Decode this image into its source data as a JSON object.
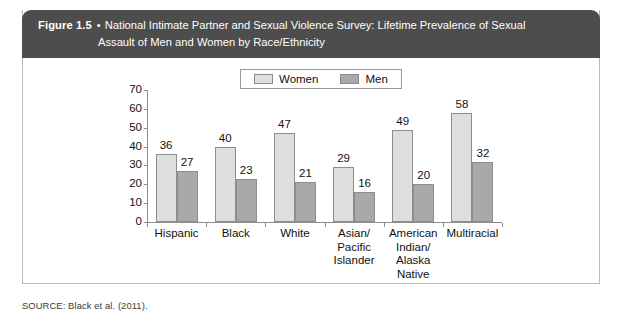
{
  "figure": {
    "number": "Figure 1.5",
    "bullet": "•",
    "caption_line1": "National Intimate Partner and Sexual Violence Survey: Lifetime Prevalence of Sexual",
    "caption_line2": "Assault of Men and Women by Race/Ethnicity",
    "source": "SOURCE: Black et al. (2011)."
  },
  "legend": {
    "women_label": "Women",
    "men_label": "Men"
  },
  "colors": {
    "header_bg": "#4d4d4d",
    "women_bar": "#dedede",
    "men_bar": "#a9a9a9",
    "axis": "#8d8d8d",
    "border": "#b9b9b9"
  },
  "chart_data": {
    "type": "bar",
    "title": "National Intimate Partner and Sexual Violence Survey: Lifetime Prevalence of Sexual Assault of Men and Women by Race/Ethnicity",
    "xlabel": "",
    "ylabel": "",
    "ylim": [
      0,
      70
    ],
    "yticks": [
      0,
      10,
      20,
      30,
      40,
      50,
      60,
      70
    ],
    "ytick_labels": [
      "0",
      "10",
      "20",
      "30",
      "40",
      "50",
      "60",
      "70"
    ],
    "grid": false,
    "legend_position": "top-center",
    "categories": [
      "Hispanic",
      "Black",
      "White",
      "Asian/\nPacific\nIslander",
      "American\nIndian/\nAlaska\nNative",
      "Multiracial"
    ],
    "series": [
      {
        "name": "Women",
        "values": [
          36,
          40,
          47,
          29,
          49,
          58
        ]
      },
      {
        "name": "Men",
        "values": [
          27,
          23,
          21,
          16,
          20,
          32
        ]
      }
    ]
  }
}
